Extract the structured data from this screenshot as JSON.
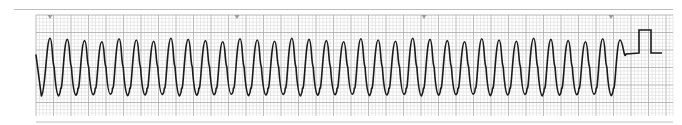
{
  "strip": {
    "description": "ECG rhythm strip",
    "grid_color_minor": "#d4d4d4",
    "grid_color_major": "#a8a8a8",
    "trace_color": "#1a1a1a",
    "marker_color": "#9a9a9a",
    "border_color": "#bdbdbd",
    "markers_x": [
      50,
      237,
      424,
      611
    ]
  },
  "chart_data": {
    "type": "line",
    "title": "",
    "xlabel": "",
    "ylabel": "",
    "grid": true,
    "cycles": 34,
    "cycle_period_px": 17.4,
    "first_peak_x": 50,
    "last_peak_x": 620,
    "peak_y_px": 40,
    "trough_y_px": 94,
    "trace_start": [
      36,
      55
    ],
    "trace_end": [
      626,
      54
    ],
    "calibration_pulse": {
      "baseline_y": 53,
      "top_y": 30,
      "rise_x": 639,
      "fall_x": 651,
      "baseline_end_x": 662
    },
    "grid_px": {
      "minor": 3.5,
      "major": 17.5,
      "left": 36,
      "top": 15,
      "right": 673,
      "bottom": 116
    }
  }
}
